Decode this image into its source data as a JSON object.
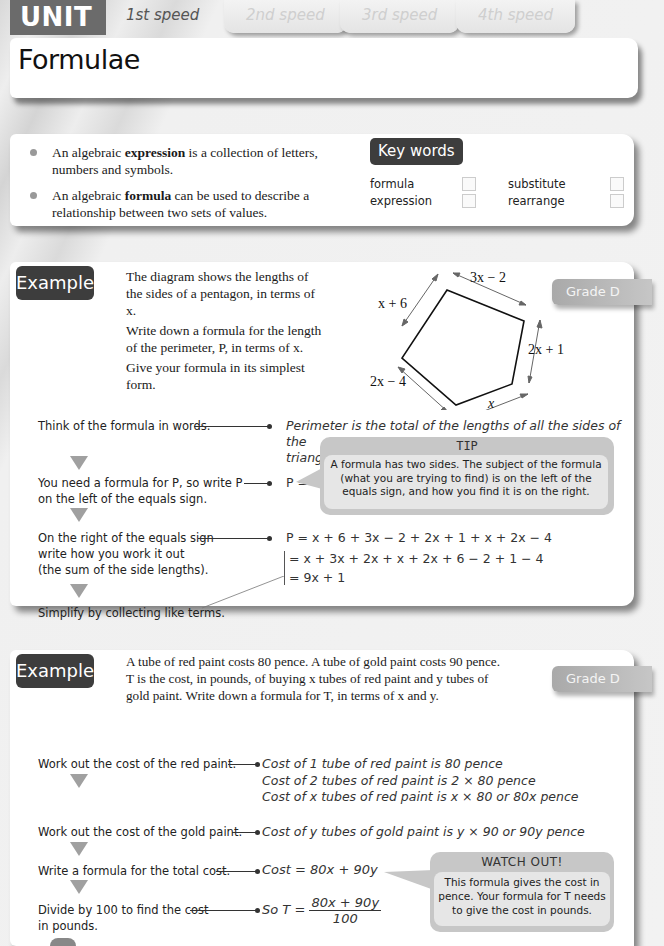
{
  "header": {
    "unit_label": "UNIT 3",
    "speed_tabs": [
      {
        "label": "1st speed",
        "active": true
      },
      {
        "label": "2nd speed",
        "active": false
      },
      {
        "label": "3rd speed",
        "active": false
      },
      {
        "label": "4th speed",
        "active": false
      }
    ],
    "title": "Formulae"
  },
  "intro": {
    "bullets": [
      {
        "before": "An algebraic ",
        "bold": "expression",
        "after": " is a collection of letters, numbers and symbols."
      },
      {
        "before": "An algebraic ",
        "bold": "formula",
        "after": " can be used to describe a relationship between two sets of values."
      }
    ],
    "keywords_title": "Key words",
    "keywords": [
      {
        "word": "formula",
        "checked": false
      },
      {
        "word": "substitute",
        "checked": false
      },
      {
        "word": "expression",
        "checked": false
      },
      {
        "word": "rearrange",
        "checked": false
      }
    ]
  },
  "example1": {
    "badge": "Example",
    "grade": "Grade D",
    "question": [
      "The diagram shows the lengths of the sides of a pentagon, in terms of x.",
      "Write down a formula for the length of the perimeter, P, in terms of x.",
      "Give your formula in its simplest form."
    ],
    "diagram_labels": {
      "top": "3x − 2",
      "upper_left": "x + 6",
      "right": "2x + 1",
      "lower_left": "2x − 4",
      "bottom": "x"
    },
    "steps": [
      {
        "label": "Think of the formula in words.",
        "work": [
          "Perimeter is the total of the lengths of all the sides of the",
          "triangle."
        ]
      },
      {
        "label": "You need a formula for P, so write P on the left of the equals sign.",
        "work": [
          "P ="
        ]
      },
      {
        "label": "On the right of the equals sign write how you work it out (the sum of the side lengths).",
        "work": [
          "P = x + 6 + 3x − 2 + 2x + 1 + x + 2x − 4",
          "= x + 3x + 2x + x + 2x + 6 − 2 + 1 − 4",
          "= 9x + 1"
        ]
      },
      {
        "label": "Simplify by collecting like terms.",
        "work": []
      }
    ],
    "step_labels_split": {
      "s2a": "You need a formula for P, so write P",
      "s2b": "on the left of the equals sign.",
      "s3a": "On the right of the equals sign",
      "s3b": "write how you work it out",
      "s3c": "(the sum of the side lengths)."
    },
    "tip": {
      "title": "TIP",
      "lines": [
        "A formula has two sides. The subject of the formula",
        "(what you are trying to find) is on the left of the",
        "equals sign, and how you find it is on the right."
      ]
    }
  },
  "example2": {
    "badge": "Example",
    "grade": "Grade D",
    "question_lines": [
      "A tube of red paint costs 80 pence. A tube of gold paint costs 90 pence.",
      "T is the cost, in pounds, of buying x tubes of red paint and y tubes of",
      "gold paint. Write down a formula for T, in terms of x and y."
    ],
    "steps": [
      {
        "label": "Work out the cost of the red paint.",
        "work": [
          "Cost of 1 tube of red paint is 80 pence",
          "Cost of 2 tubes of red paint is 2 × 80 pence",
          "Cost of x tubes of red paint is x × 80 or 80x pence"
        ]
      },
      {
        "label": "Work out the cost of the gold paint.",
        "work": [
          "Cost of y tubes of gold paint is y × 90 or 90y pence"
        ]
      },
      {
        "label": "Write a formula for the total cost.",
        "work": [
          "Cost = 80x + 90y"
        ]
      },
      {
        "label_a": "Divide by 100 to find the cost",
        "label_b": "in pounds.",
        "work_prefix": "So T =",
        "numerator": "80x + 90y",
        "denominator": "100"
      }
    ],
    "watch_out": {
      "title": "WATCH OUT!",
      "lines": [
        "This formula gives the cost in",
        "pence. Your formula for T needs",
        "to give the cost in pounds."
      ]
    }
  },
  "colors": {
    "badge_dark": "#3d3d3d",
    "unit_badge": "#6b6b6b",
    "grade_badge": "#b0b0b0",
    "callout_outer": "#c7c7c7",
    "callout_inner": "#e6e6e6"
  }
}
